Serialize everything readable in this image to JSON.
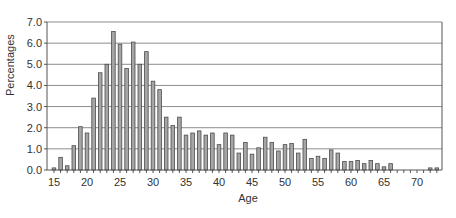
{
  "chart_data": {
    "type": "bar",
    "title": "",
    "xlabel": "Age",
    "ylabel": "Percentages",
    "ylim": [
      0,
      7.0
    ],
    "yticks": [
      "0.0",
      "1.0",
      "2.0",
      "3.0",
      "4.0",
      "5.0",
      "6.0",
      "7.0"
    ],
    "xticks": [
      "15",
      "20",
      "25",
      "30",
      "35",
      "40",
      "45",
      "50",
      "55",
      "60",
      "65",
      "70"
    ],
    "grid": "horizontal",
    "legend": null,
    "categories": [
      15,
      16,
      17,
      18,
      19,
      20,
      21,
      22,
      23,
      24,
      25,
      26,
      27,
      28,
      29,
      30,
      31,
      32,
      33,
      34,
      35,
      36,
      37,
      38,
      39,
      40,
      41,
      42,
      43,
      44,
      45,
      46,
      47,
      48,
      49,
      50,
      51,
      52,
      53,
      54,
      55,
      56,
      57,
      58,
      59,
      60,
      61,
      62,
      63,
      64,
      65,
      66,
      67,
      68,
      69,
      70,
      71,
      72,
      73
    ],
    "values": [
      0.1,
      0.6,
      0.2,
      1.15,
      2.05,
      1.75,
      3.4,
      4.6,
      5.0,
      6.55,
      5.95,
      4.8,
      6.05,
      5.0,
      5.6,
      4.2,
      3.8,
      2.5,
      2.1,
      2.5,
      1.65,
      1.75,
      1.85,
      1.65,
      1.75,
      1.2,
      1.75,
      1.65,
      0.8,
      1.3,
      0.75,
      1.05,
      1.55,
      1.3,
      0.9,
      1.2,
      1.25,
      0.8,
      1.45,
      0.55,
      0.65,
      0.55,
      0.95,
      0.8,
      0.4,
      0.4,
      0.45,
      0.3,
      0.45,
      0.3,
      0.15,
      0.3,
      0,
      0,
      0,
      0,
      0,
      0.1,
      0.1
    ],
    "colors": {
      "bar_fill": "#a6a6a6",
      "bar_stroke": "#4d4d4d",
      "grid": "#8c8c8c",
      "axis": "#555555"
    }
  }
}
